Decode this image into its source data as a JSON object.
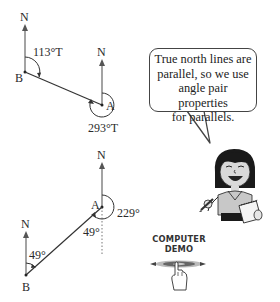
{
  "diagram_top": {
    "north_label_b": "N",
    "north_label_a": "N",
    "point_b": "B",
    "point_a": "A",
    "bearing_b_to_a": "113°T",
    "bearing_a_to_b": "293°T"
  },
  "diagram_bottom": {
    "north_label_a": "N",
    "north_label_b": "N",
    "point_a": "A",
    "point_b": "B",
    "angle_at_a_reflex": "229°",
    "angle_at_a_alternate": "49°",
    "angle_at_b": "49°"
  },
  "speech_bubble": {
    "line1": "True north lines are",
    "line2": "parallel, so we use",
    "line3": "angle pair properties",
    "line4": "for parallels."
  },
  "computer_demo": {
    "line1": "COMPUTER",
    "line2": "DEMO",
    "icon": "hand-pointer-disc-icon"
  },
  "character": {
    "icon": "girl-with-notepad-icon"
  },
  "colors": {
    "line": "#333333",
    "text": "#2a2a2a"
  }
}
